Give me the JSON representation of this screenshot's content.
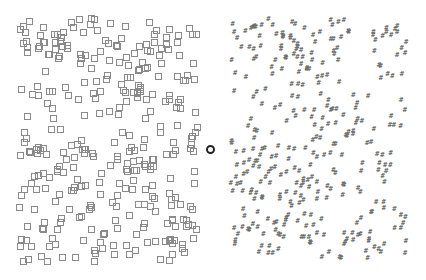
{
  "display": {
    "width": 426,
    "height": 280,
    "background": "#ffffff"
  },
  "left_panel": {
    "element": "open-square",
    "color": "#8a8a8a",
    "bounds": {
      "x0": 15,
      "y0": 15,
      "x1": 200,
      "y1": 265
    },
    "count": 330,
    "size": 6,
    "seed": 17
  },
  "right_panel": {
    "element": "hash",
    "glyph": "#",
    "color": "#6e6e6e",
    "bounds": {
      "x0": 228,
      "y0": 15,
      "x1": 410,
      "y1": 262
    },
    "count": 330,
    "seed": 91
  },
  "fixation": {
    "shape": "circle",
    "cx": 211,
    "cy": 150,
    "radius": 4,
    "color": "#222222"
  }
}
